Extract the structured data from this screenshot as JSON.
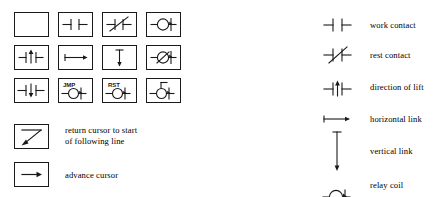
{
  "palette": {
    "rows": [
      [
        {
          "name": "blank-cell",
          "symbol": "blank",
          "label": ""
        },
        {
          "name": "work-contact-cell",
          "symbol": "work-contact",
          "label": ""
        },
        {
          "name": "rest-contact-cell",
          "symbol": "rest-contact",
          "label": ""
        },
        {
          "name": "relay-coil-cell",
          "symbol": "relay-coil",
          "label": ""
        }
      ],
      [
        {
          "name": "direction-of-lift-cell",
          "symbol": "direction-of-lift",
          "label": ""
        },
        {
          "name": "horizontal-link-cell",
          "symbol": "horizontal-link",
          "label": ""
        },
        {
          "name": "vertical-link-cell",
          "symbol": "vertical-link",
          "label": ""
        },
        {
          "name": "negated-relay-coil-cell",
          "symbol": "negated-relay-coil",
          "label": ""
        }
      ],
      [
        {
          "name": "direction-of-fall-cell",
          "symbol": "direction-of-fall",
          "label": ""
        },
        {
          "name": "jump-coil-cell",
          "symbol": "jump-coil",
          "label": "JMP"
        },
        {
          "name": "reset-coil-cell",
          "symbol": "reset-coil",
          "label": "RST"
        },
        {
          "name": "set-coil-cell",
          "symbol": "set-coil",
          "label": ""
        }
      ]
    ]
  },
  "commands": [
    {
      "name": "return-cursor",
      "symbol": "return-cursor",
      "label": "return cursor to start\nof following line"
    },
    {
      "name": "advance-cursor",
      "symbol": "advance-cursor",
      "label": "advance cursor"
    }
  ],
  "legend": {
    "items": [
      {
        "name": "legend-work-contact",
        "symbol": "work-contact",
        "label": "work contact"
      },
      {
        "name": "legend-rest-contact",
        "symbol": "rest-contact",
        "label": "rest contact"
      },
      {
        "name": "legend-direction-of-lift",
        "symbol": "direction-of-lift",
        "label": "direction of lift"
      },
      {
        "name": "legend-horizontal-link",
        "symbol": "horizontal-link",
        "label": "horizontal link"
      },
      {
        "name": "legend-vertical-link",
        "symbol": "vertical-link",
        "label": "vertical link"
      },
      {
        "name": "legend-relay-coil",
        "symbol": "relay-coil",
        "label": "relay coil"
      }
    ]
  },
  "colors": {
    "ink": "#1a1a1a",
    "background": "#ffffff"
  }
}
